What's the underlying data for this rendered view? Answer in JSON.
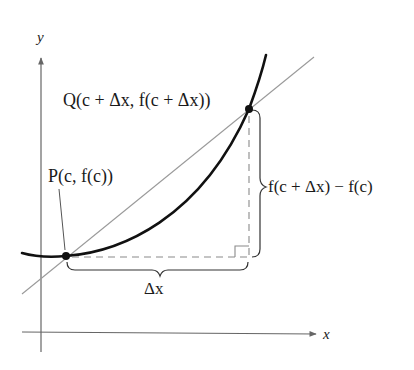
{
  "diagram": {
    "axes": {
      "x_label": "x",
      "y_label": "y"
    },
    "points": {
      "P": {
        "label": "P(c, f(c))",
        "name": "P",
        "coord_text": "(c, f(c))"
      },
      "Q": {
        "label": "Q(c + Δx, f(c + Δx))",
        "name": "Q",
        "coord_text": "(c + Δx, f(c + Δx))"
      }
    },
    "annotations": {
      "horizontal_change": "Δx",
      "vertical_change": "f(c + Δx) − f(c)"
    },
    "colors": {
      "curve": "#111111",
      "secant": "#9a9a9a",
      "axes": "#666666",
      "dashes": "#8a8a8a",
      "text": "#1a1a1a"
    }
  }
}
